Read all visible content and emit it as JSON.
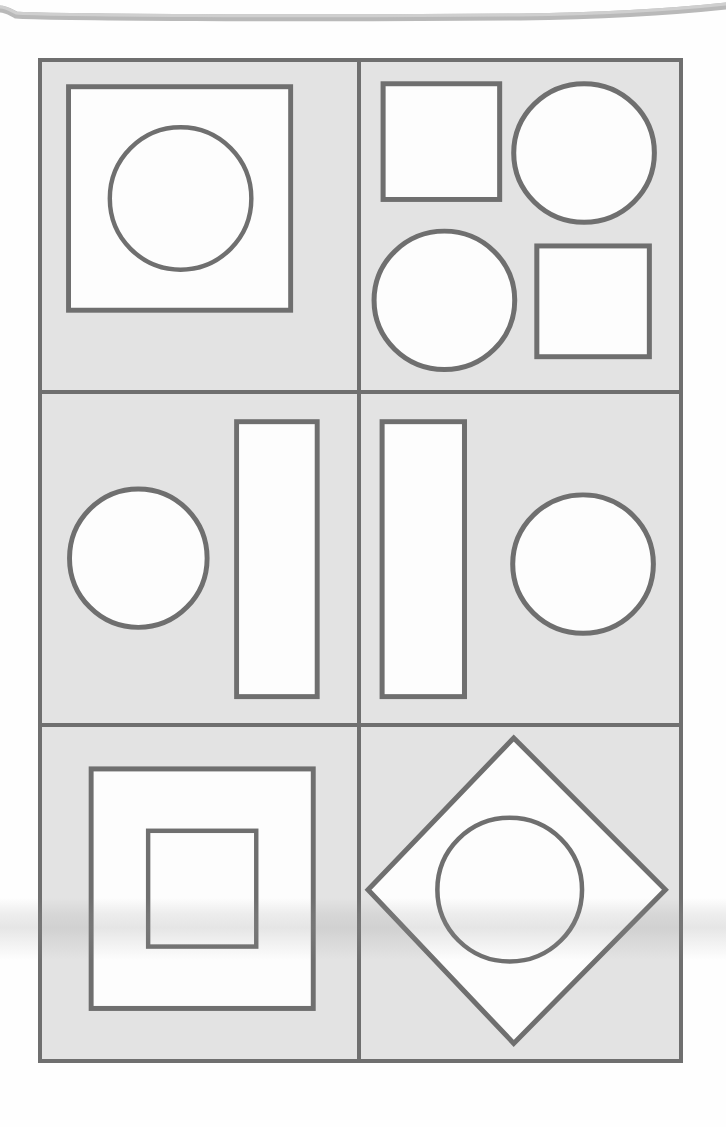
{
  "page": {
    "background_color": "#fefefe",
    "scan_artifacts": [
      {
        "name": "page-edge-curve",
        "position": "top",
        "color": "#b4b4b4"
      },
      {
        "name": "horizontal-light-band",
        "position": "lower",
        "color": "#969696"
      }
    ]
  },
  "figure": {
    "name": "shape-grid",
    "columns": 2,
    "rows": 3,
    "border_color": "#6f6f6f",
    "cell_fill_color": "#e3e3e3",
    "shape_fill_color": "#fdfdfd",
    "shape_stroke_color": "#6f6f6f",
    "cells": [
      {
        "id": "cell-1",
        "row": 1,
        "column": 1,
        "label": "square containing circle",
        "shapes": [
          {
            "type": "square",
            "name": "outer-square"
          },
          {
            "type": "circle",
            "name": "inner-circle"
          }
        ]
      },
      {
        "id": "cell-2",
        "row": 1,
        "column": 2,
        "label": "two squares and two circles alternating",
        "shapes": [
          {
            "type": "square",
            "name": "square-top-left"
          },
          {
            "type": "circle",
            "name": "circle-top-right"
          },
          {
            "type": "circle",
            "name": "circle-bottom-left"
          },
          {
            "type": "square",
            "name": "square-bottom-right"
          }
        ]
      },
      {
        "id": "cell-3",
        "row": 2,
        "column": 1,
        "label": "circle left, tall rectangle right",
        "shapes": [
          {
            "type": "circle",
            "name": "circle-left"
          },
          {
            "type": "rectangle",
            "name": "tall-rectangle-right"
          }
        ]
      },
      {
        "id": "cell-4",
        "row": 2,
        "column": 2,
        "label": "tall rectangle left, circle right",
        "shapes": [
          {
            "type": "rectangle",
            "name": "tall-rectangle-left"
          },
          {
            "type": "circle",
            "name": "circle-right"
          }
        ]
      },
      {
        "id": "cell-5",
        "row": 3,
        "column": 1,
        "label": "square containing smaller square",
        "shapes": [
          {
            "type": "square",
            "name": "outer-square"
          },
          {
            "type": "square",
            "name": "inner-square"
          }
        ]
      },
      {
        "id": "cell-6",
        "row": 3,
        "column": 2,
        "label": "diamond containing circle",
        "shapes": [
          {
            "type": "diamond",
            "name": "outer-diamond"
          },
          {
            "type": "circle",
            "name": "inner-circle"
          }
        ]
      }
    ]
  }
}
